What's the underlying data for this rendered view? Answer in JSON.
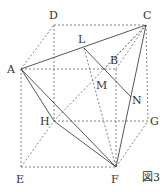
{
  "figure_label": "図3",
  "points": {
    "A": {
      "label": "A",
      "x": 21,
      "y": 69
    },
    "B": {
      "label": "B",
      "x": 116,
      "y": 69
    },
    "C": {
      "label": "C",
      "x": 146,
      "y": 25
    },
    "D": {
      "label": "D",
      "x": 54,
      "y": 25
    },
    "E": {
      "label": "E",
      "x": 21,
      "y": 167
    },
    "F": {
      "label": "F",
      "x": 116,
      "y": 167
    },
    "G": {
      "label": "G",
      "x": 148,
      "y": 121
    },
    "H": {
      "label": "H",
      "x": 54,
      "y": 121
    },
    "L": {
      "label": "L",
      "x": 84,
      "y": 48
    },
    "M": {
      "label": "M",
      "x": 103,
      "y": 70
    },
    "N": {
      "label": "N",
      "x": 131,
      "y": 97
    }
  },
  "colors": {
    "line": "#444444",
    "dash": "#666666"
  }
}
